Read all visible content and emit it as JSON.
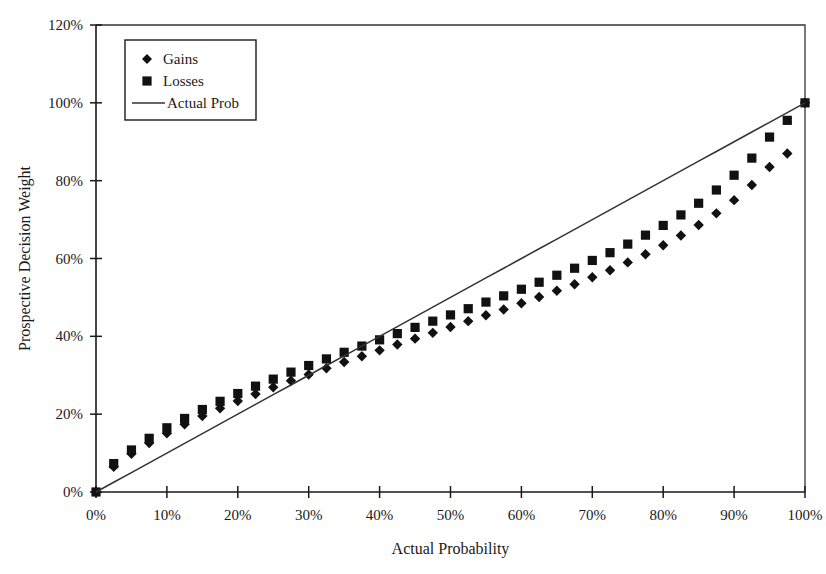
{
  "chart_data": {
    "type": "scatter",
    "title": "",
    "xlabel": "Actual Probability",
    "ylabel": "Prospective Decision Weight",
    "xlim": [
      0,
      100
    ],
    "ylim": [
      0,
      120
    ],
    "grid": false,
    "legend_position": "top-left",
    "x_ticks": [
      "0%",
      "10%",
      "20%",
      "30%",
      "40%",
      "50%",
      "60%",
      "70%",
      "80%",
      "90%",
      "100%"
    ],
    "x_tick_values": [
      0,
      10,
      20,
      30,
      40,
      50,
      60,
      70,
      80,
      90,
      100
    ],
    "y_ticks": [
      "0%",
      "20%",
      "40%",
      "60%",
      "80%",
      "100%",
      "120%"
    ],
    "y_tick_values": [
      0,
      20,
      40,
      60,
      80,
      100,
      120
    ],
    "legend": [
      {
        "name": "Gains",
        "marker": "diamond",
        "color": "#111111"
      },
      {
        "name": "Losses",
        "marker": "square",
        "color": "#111111"
      },
      {
        "name": "Actual Prob",
        "marker": "line",
        "color": "#333333"
      }
    ],
    "x": [
      0,
      2.5,
      5,
      7.5,
      10,
      12.5,
      15,
      17.5,
      20,
      22.5,
      25,
      27.5,
      30,
      32.5,
      35,
      37.5,
      40,
      42.5,
      45,
      47.5,
      50,
      52.5,
      55,
      57.5,
      60,
      62.5,
      65,
      67.5,
      70,
      72.5,
      75,
      77.5,
      80,
      82.5,
      85,
      87.5,
      90,
      92.5,
      95,
      97.5,
      100
    ],
    "series": [
      {
        "name": "Gains",
        "marker": "diamond",
        "color": "#111111",
        "values": [
          0,
          6.5,
          9.8,
          12.6,
          15.1,
          17.4,
          19.5,
          21.5,
          23.4,
          25.2,
          26.9,
          28.6,
          30.2,
          31.8,
          33.4,
          34.9,
          36.4,
          37.9,
          39.4,
          40.9,
          42.4,
          43.9,
          45.4,
          46.9,
          48.5,
          50.1,
          51.7,
          53.4,
          55.2,
          57.0,
          59.0,
          61.1,
          63.4,
          65.9,
          68.6,
          71.6,
          75.0,
          78.9,
          83.5,
          87.0,
          100
        ]
      },
      {
        "name": "Losses",
        "marker": "square",
        "color": "#111111",
        "values": [
          0,
          7.3,
          10.8,
          13.8,
          16.5,
          18.9,
          21.2,
          23.3,
          25.3,
          27.2,
          29.0,
          30.8,
          32.5,
          34.2,
          35.9,
          37.5,
          39.1,
          40.7,
          42.3,
          43.9,
          45.5,
          47.1,
          48.8,
          50.4,
          52.1,
          53.9,
          55.7,
          57.5,
          59.5,
          61.5,
          63.7,
          66.0,
          68.5,
          71.2,
          74.2,
          77.6,
          81.4,
          85.8,
          91.2,
          95.5,
          100
        ]
      },
      {
        "name": "Actual Prob",
        "marker": "line",
        "color": "#333333",
        "values": [
          0,
          2.5,
          5,
          7.5,
          10,
          12.5,
          15,
          17.5,
          20,
          22.5,
          25,
          27.5,
          30,
          32.5,
          35,
          37.5,
          40,
          42.5,
          45,
          47.5,
          50,
          52.5,
          55,
          57.5,
          60,
          62.5,
          65,
          67.5,
          70,
          72.5,
          75,
          77.5,
          80,
          82.5,
          85,
          87.5,
          90,
          92.5,
          95,
          97.5,
          100
        ]
      }
    ]
  }
}
